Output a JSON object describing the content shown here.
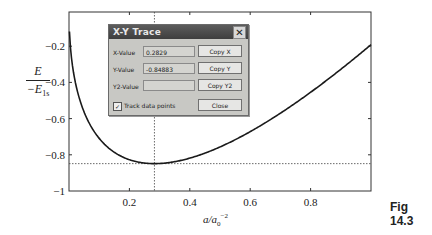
{
  "chart_data": {
    "type": "line",
    "title": "",
    "xlabel": "a/a0^-2",
    "ylabel": "E / -E1s",
    "xlim": [
      0,
      1
    ],
    "ylim": [
      -1,
      -0.1
    ],
    "x_ticks": [
      "0.2",
      "0.4",
      "0.6",
      "0.8"
    ],
    "y_ticks": [
      "-0.2",
      "-0.4",
      "-0.6",
      "-0.8",
      "-1"
    ],
    "grid": false,
    "series": [
      {
        "name": "E(a)",
        "x": [
          0.002,
          0.01,
          0.02,
          0.05,
          0.1,
          0.15,
          0.2,
          0.2829,
          0.35,
          0.4,
          0.5,
          0.6,
          0.7,
          0.8,
          0.9,
          1.0
        ],
        "values": [
          -0.14,
          -0.29,
          -0.39,
          -0.56,
          -0.71,
          -0.79,
          -0.83,
          -0.849,
          -0.84,
          -0.82,
          -0.76,
          -0.67,
          -0.57,
          -0.45,
          -0.33,
          -0.19
        ]
      }
    ],
    "annotations": [
      {
        "type": "vline",
        "x": 0.2829,
        "style": "dotted"
      },
      {
        "type": "hline",
        "y": -0.84883,
        "style": "dotted"
      }
    ]
  },
  "axis": {
    "y_num": "E",
    "y_den_prefix": "−E",
    "y_den_sub": "1s",
    "x_a": "a/a",
    "x_sub": "0",
    "x_sup": "−2",
    "x_tick_labels": [
      "0.2",
      "0.4",
      "0.6",
      "0.8"
    ],
    "y_tick_labels": [
      "−0.2",
      "−0.4",
      "−0.6",
      "−0.8",
      "−1"
    ]
  },
  "dialog": {
    "title": "X-Y Trace",
    "close_glyph": "✕",
    "x_label": "X-Value",
    "x_value": "0.2829",
    "y_label": "Y-Value",
    "y_value": "-0.84883",
    "y2_label": "Y2-Value",
    "y2_value": "",
    "copy_x": "Copy X",
    "copy_y": "Copy Y",
    "copy_y2": "Copy Y2",
    "track_label": "Track data points",
    "track_checked": "✓",
    "close_label": "Close"
  },
  "caption": "Fig 14.3"
}
